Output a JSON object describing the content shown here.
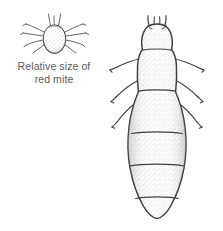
{
  "figure": {
    "kind": "scientific-line-drawing",
    "style": "stippled pen-and-ink",
    "background_color": "#ffffff",
    "ink_color": "#3a3a3a",
    "stipple_color": "#9a9a9a",
    "text_color": "#5b5b5b"
  },
  "caption": {
    "line1": "Relative size of",
    "line2": "red mite",
    "full_text": "Relative size of red mite"
  },
  "specimens": [
    {
      "name": "red mite",
      "role": "scale-reference",
      "position": "top-left",
      "body_shape": "pear",
      "leg_pairs": 4,
      "antennae": 2,
      "approx_width_px": 30,
      "approx_height_px": 34
    },
    {
      "name": "louse",
      "role": "main-subject",
      "position": "right",
      "body_shape": "elongated-oval",
      "leg_pairs": 3,
      "antennae": 2,
      "abdominal_segment_lines": 4,
      "approx_width_px": 72,
      "approx_height_px": 206
    }
  ]
}
